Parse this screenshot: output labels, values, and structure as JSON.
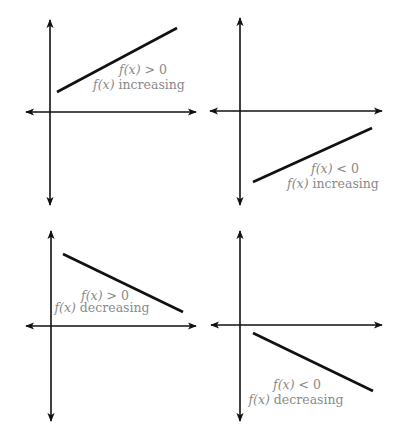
{
  "diagram": {
    "colors": {
      "axis": "#111111",
      "line": "#111111",
      "label": "#8a8a8a",
      "background": "#ffffff"
    },
    "panels": [
      {
        "id": "top-left",
        "sign": "f(x) > 0",
        "trend": "f(x) increasing",
        "sign_fn": "f(x)",
        "sign_rel": "> 0",
        "trend_fn": "f(x)",
        "trend_word": "increasing"
      },
      {
        "id": "top-right",
        "sign": "f(x) < 0",
        "trend": "f(x) increasing",
        "sign_fn": "f(x)",
        "sign_rel": "< 0",
        "trend_fn": "f(x)",
        "trend_word": "increasing"
      },
      {
        "id": "bottom-left",
        "sign": "f(x) > 0",
        "trend": "f(x) decreasing",
        "sign_fn": "f(x)",
        "sign_rel": "> 0",
        "trend_fn": "f(x)",
        "trend_word": "decreasing"
      },
      {
        "id": "bottom-right",
        "sign": "f(x) < 0",
        "trend": "f(x) decreasing",
        "sign_fn": "f(x)",
        "sign_rel": "< 0",
        "trend_fn": "f(x)",
        "trend_word": "decreasing"
      }
    ]
  }
}
